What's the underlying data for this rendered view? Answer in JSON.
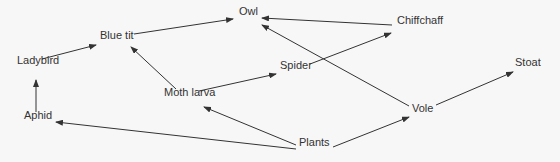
{
  "diagram": {
    "nodes": [
      {
        "id": "owl",
        "label": "Owl",
        "x": 239,
        "y": 12
      },
      {
        "id": "chiffchaff",
        "label": "Chiffchaff",
        "x": 397,
        "y": 21
      },
      {
        "id": "bluetit",
        "label": "Blue tit",
        "x": 100,
        "y": 36
      },
      {
        "id": "ladybird",
        "label": "Ladybird",
        "x": 17,
        "y": 61
      },
      {
        "id": "spider",
        "label": "Spider",
        "x": 280,
        "y": 66
      },
      {
        "id": "stoat",
        "label": "Stoat",
        "x": 515,
        "y": 63
      },
      {
        "id": "mothlarva",
        "label": "Moth larva",
        "x": 164,
        "y": 93
      },
      {
        "id": "aphid",
        "label": "Aphid",
        "x": 24,
        "y": 116
      },
      {
        "id": "vole",
        "label": "Vole",
        "x": 412,
        "y": 109
      },
      {
        "id": "plants",
        "label": "Plants",
        "x": 299,
        "y": 143
      }
    ],
    "edges": [
      {
        "from": "aphid",
        "to": "ladybird",
        "x1": 36,
        "y1": 112,
        "x2": 36,
        "y2": 80
      },
      {
        "from": "ladybird",
        "to": "bluetit",
        "x1": 42,
        "y1": 59,
        "x2": 96,
        "y2": 45
      },
      {
        "from": "bluetit",
        "to": "owl",
        "x1": 134,
        "y1": 34,
        "x2": 233,
        "y2": 19
      },
      {
        "from": "chiffchaff",
        "to": "owl",
        "x1": 392,
        "y1": 25,
        "x2": 262,
        "y2": 18
      },
      {
        "from": "vole",
        "to": "owl",
        "x1": 409,
        "y1": 106,
        "x2": 262,
        "y2": 25
      },
      {
        "from": "spider",
        "to": "chiffchaff",
        "x1": 310,
        "y1": 64,
        "x2": 391,
        "y2": 33
      },
      {
        "from": "mothlarva",
        "to": "spider",
        "x1": 199,
        "y1": 91,
        "x2": 276,
        "y2": 74
      },
      {
        "from": "mothlarva",
        "to": "bluetit",
        "x1": 176,
        "y1": 89,
        "x2": 131,
        "y2": 47
      },
      {
        "from": "plants",
        "to": "mothlarva",
        "x1": 296,
        "y1": 145,
        "x2": 204,
        "y2": 107
      },
      {
        "from": "plants",
        "to": "aphid",
        "x1": 296,
        "y1": 149,
        "x2": 56,
        "y2": 122
      },
      {
        "from": "plants",
        "to": "vole",
        "x1": 333,
        "y1": 147,
        "x2": 409,
        "y2": 117
      },
      {
        "from": "vole",
        "to": "stoat",
        "x1": 436,
        "y1": 105,
        "x2": 513,
        "y2": 72
      }
    ],
    "colors": {
      "line": "#333333",
      "text": "#333333",
      "background": "#f7f7f7"
    }
  }
}
